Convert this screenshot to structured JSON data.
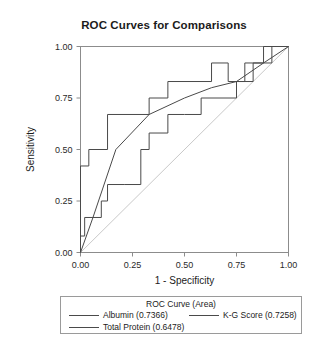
{
  "chart_data": {
    "type": "line",
    "title": "ROC Curves for Comparisons",
    "xlabel": "1 - Specificity",
    "ylabel": "Sensitivity",
    "xlim": [
      0,
      1
    ],
    "ylim": [
      0,
      1
    ],
    "grid": false,
    "legend_position": "bottom",
    "legend_title": "ROC Curve (Area)",
    "xticks": [
      "0.00",
      "0.25",
      "0.50",
      "0.75",
      "1.00"
    ],
    "xtick_values": [
      0,
      0.25,
      0.5,
      0.75,
      1
    ],
    "yticks": [
      "0.00",
      "0.25",
      "0.50",
      "0.75",
      "1.00"
    ],
    "ytick_values": [
      0,
      0.25,
      0.5,
      0.75,
      1
    ],
    "reference_line": {
      "name": "chance-diagonal",
      "x": [
        0,
        1
      ],
      "y": [
        0,
        1
      ]
    },
    "series": [
      {
        "name": "Albumin",
        "area": 0.7366,
        "label": "Albumin (0.7366)",
        "color": "#4a4a4a",
        "x": [
          0.0,
          0.0,
          0.04,
          0.04,
          0.13,
          0.13,
          0.33,
          0.33,
          0.42,
          0.42,
          0.63,
          0.63,
          0.71,
          0.71,
          0.79,
          0.79,
          0.88,
          0.88,
          1.0
        ],
        "y": [
          0.0,
          0.42,
          0.42,
          0.5,
          0.5,
          0.67,
          0.67,
          0.75,
          0.75,
          0.83,
          0.83,
          0.92,
          0.92,
          0.83,
          0.83,
          0.92,
          0.92,
          1.0,
          1.0
        ]
      },
      {
        "name": "K-G Score",
        "area": 0.7258,
        "label": "K-G Score (0.7258)",
        "color": "#4a4a4a",
        "x": [
          0.0,
          0.06,
          0.17,
          0.33,
          0.5,
          0.63,
          0.75,
          0.88,
          1.0
        ],
        "y": [
          0.0,
          0.17,
          0.5,
          0.67,
          0.75,
          0.8,
          0.83,
          0.92,
          1.0
        ]
      },
      {
        "name": "Total Protein",
        "area": 0.6478,
        "label": "Total Protein (0.6478)",
        "color": "#4a4a4a",
        "x": [
          0.0,
          0.0,
          0.02,
          0.02,
          0.06,
          0.06,
          0.1,
          0.1,
          0.13,
          0.13,
          0.21,
          0.21,
          0.29,
          0.29,
          0.33,
          0.33,
          0.42,
          0.42,
          0.5,
          0.5,
          0.58,
          0.58,
          0.75,
          0.75,
          0.83,
          0.83,
          0.92,
          0.92,
          1.0
        ],
        "y": [
          0.0,
          0.08,
          0.08,
          0.17,
          0.17,
          0.17,
          0.17,
          0.25,
          0.25,
          0.33,
          0.33,
          0.33,
          0.33,
          0.5,
          0.5,
          0.58,
          0.58,
          0.67,
          0.67,
          0.67,
          0.67,
          0.75,
          0.75,
          0.83,
          0.83,
          0.92,
          0.92,
          1.0,
          1.0
        ]
      }
    ]
  },
  "legend": {
    "heading": "ROC Curve (Area)",
    "entries": [
      {
        "label": "Albumin (0.7366)"
      },
      {
        "label": "K-G Score (0.7258)"
      },
      {
        "label": "Total Protein (0.6478)"
      }
    ]
  }
}
